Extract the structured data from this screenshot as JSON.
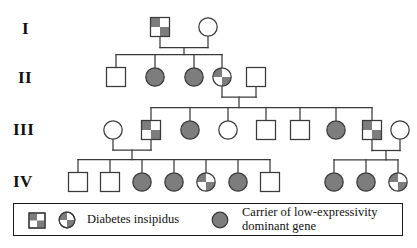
{
  "figure": {
    "type": "pedigree-chart",
    "title": "",
    "generation_labels": [
      "I",
      "II",
      "III",
      "IV"
    ]
  },
  "colors": {
    "affected_fill": "#7d7d7d",
    "carrier_fill": "#7d7d7d",
    "unaffected_fill": "#ffffff",
    "stroke": "#3a3a3a",
    "text": "#111111",
    "legend_border": "#1a1a1a"
  },
  "legend": {
    "entries": [
      {
        "symbols": [
          "quartered-square",
          "quartered-circle"
        ],
        "label": "Diabetes insipidus"
      },
      {
        "symbols": [
          "filled-circle"
        ],
        "label": "Carrier of low-expressivity\ndominant gene"
      }
    ],
    "entry_1_label": "Diabetes insipidus",
    "entry_2_label": "Carrier of low-expressivity\ndominant gene"
  },
  "chart_data": {
    "type": "pedigree",
    "generations": [
      {
        "label": "I",
        "y": 27,
        "individuals": [
          {
            "id": "I-1",
            "sex": "male",
            "shape": "square",
            "status": "quartered",
            "cx": 160,
            "cy": 27
          },
          {
            "id": "I-2",
            "sex": "female",
            "shape": "circle",
            "status": "unaffected",
            "cx": 208,
            "cy": 27
          }
        ]
      },
      {
        "label": "II",
        "y": 77,
        "individuals": [
          {
            "id": "II-1",
            "sex": "male",
            "shape": "square",
            "status": "unaffected",
            "cx": 116,
            "cy": 77
          },
          {
            "id": "II-2",
            "sex": "female",
            "shape": "circle",
            "status": "filled",
            "cx": 155,
            "cy": 77
          },
          {
            "id": "II-3",
            "sex": "female",
            "shape": "circle",
            "status": "filled",
            "cx": 194,
            "cy": 77
          },
          {
            "id": "II-4",
            "sex": "female",
            "shape": "circle",
            "status": "quartered",
            "cx": 222,
            "cy": 77
          },
          {
            "id": "II-5",
            "sex": "male",
            "shape": "square",
            "status": "unaffected",
            "cx": 256,
            "cy": 77
          }
        ]
      },
      {
        "label": "III",
        "y": 130,
        "individuals": [
          {
            "id": "III-1",
            "sex": "female",
            "shape": "circle",
            "status": "unaffected",
            "cx": 113,
            "cy": 130
          },
          {
            "id": "III-2",
            "sex": "male",
            "shape": "square",
            "status": "quartered",
            "cx": 151,
            "cy": 130
          },
          {
            "id": "III-3",
            "sex": "female",
            "shape": "circle",
            "status": "filled",
            "cx": 190,
            "cy": 130
          },
          {
            "id": "III-4",
            "sex": "female",
            "shape": "circle",
            "status": "unaffected",
            "cx": 228,
            "cy": 130
          },
          {
            "id": "III-5",
            "sex": "male",
            "shape": "square",
            "status": "unaffected",
            "cx": 266,
            "cy": 130
          },
          {
            "id": "III-6",
            "sex": "male",
            "shape": "square",
            "status": "unaffected",
            "cx": 300,
            "cy": 130
          },
          {
            "id": "III-7",
            "sex": "female",
            "shape": "circle",
            "status": "filled",
            "cx": 336,
            "cy": 130
          },
          {
            "id": "III-8",
            "sex": "male",
            "shape": "square",
            "status": "quartered",
            "cx": 372,
            "cy": 130
          },
          {
            "id": "III-9",
            "sex": "female",
            "shape": "circle",
            "status": "unaffected",
            "cx": 400,
            "cy": 130
          }
        ]
      },
      {
        "label": "IV",
        "y": 182,
        "individuals": [
          {
            "id": "IV-1",
            "sex": "male",
            "shape": "square",
            "status": "unaffected",
            "cx": 78,
            "cy": 182
          },
          {
            "id": "IV-2",
            "sex": "male",
            "shape": "square",
            "status": "unaffected",
            "cx": 110,
            "cy": 182
          },
          {
            "id": "IV-3",
            "sex": "female",
            "shape": "circle",
            "status": "filled",
            "cx": 142,
            "cy": 182
          },
          {
            "id": "IV-4",
            "sex": "female",
            "shape": "circle",
            "status": "filled",
            "cx": 174,
            "cy": 182
          },
          {
            "id": "IV-5",
            "sex": "female",
            "shape": "circle",
            "status": "quartered",
            "cx": 206,
            "cy": 182
          },
          {
            "id": "IV-6",
            "sex": "female",
            "shape": "circle",
            "status": "filled",
            "cx": 238,
            "cy": 182
          },
          {
            "id": "IV-7",
            "sex": "male",
            "shape": "square",
            "status": "unaffected",
            "cx": 270,
            "cy": 182
          },
          {
            "id": "IV-8",
            "sex": "female",
            "shape": "circle",
            "status": "filled",
            "cx": 334,
            "cy": 182
          },
          {
            "id": "IV-9",
            "sex": "female",
            "shape": "circle",
            "status": "filled",
            "cx": 366,
            "cy": 182
          },
          {
            "id": "IV-10",
            "sex": "female",
            "shape": "circle",
            "status": "quartered",
            "cx": 398,
            "cy": 182
          }
        ]
      }
    ],
    "matings": [
      {
        "partners": [
          "I-1",
          "I-2"
        ],
        "children": [
          "II-1",
          "II-2",
          "II-3",
          "II-4"
        ]
      },
      {
        "partners": [
          "II-4",
          "II-5"
        ],
        "children": [
          "III-2",
          "III-3",
          "III-4",
          "III-5",
          "III-6",
          "III-7",
          "III-8"
        ]
      },
      {
        "partners": [
          "III-1",
          "III-2"
        ],
        "children": [
          "IV-1",
          "IV-2",
          "IV-3",
          "IV-4",
          "IV-5",
          "IV-6",
          "IV-7"
        ]
      },
      {
        "partners": [
          "III-8",
          "III-9"
        ],
        "children": [
          "IV-8",
          "IV-9",
          "IV-10"
        ]
      }
    ]
  },
  "label_positions": [
    {
      "text": "I",
      "x": 22,
      "y": 20
    },
    {
      "text": "II",
      "x": 18,
      "y": 69
    },
    {
      "text": "III",
      "x": 14,
      "y": 121
    },
    {
      "text": "IV",
      "x": 14,
      "y": 173
    }
  ]
}
